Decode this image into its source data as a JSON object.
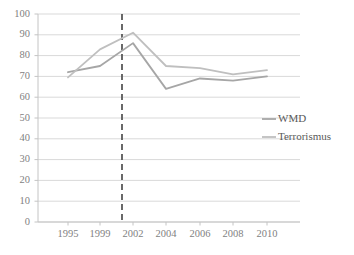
{
  "chart_data": {
    "type": "line",
    "title": "",
    "subtitle": "",
    "xlabel": "",
    "ylabel": "",
    "x": [
      1995,
      1999,
      2002,
      2004,
      2006,
      2008,
      2010
    ],
    "categories": [
      "1995",
      "1999",
      "2002",
      "2004",
      "2006",
      "2008",
      "2010"
    ],
    "series": [
      {
        "name": "WMD",
        "color": "#a6a6a6",
        "values": [
          72,
          75,
          86,
          64,
          69,
          68,
          70
        ]
      },
      {
        "name": "Terrorismus",
        "color": "#bfbfbf",
        "values": [
          69.5,
          83,
          91,
          75,
          74,
          71,
          73
        ]
      }
    ],
    "ylim": [
      0,
      100
    ],
    "ytick_values": [
      0,
      10,
      20,
      30,
      40,
      50,
      60,
      70,
      80,
      90,
      100
    ],
    "ytick_labels": [
      "0",
      "10",
      "20",
      "30",
      "40",
      "50",
      "60",
      "70",
      "80",
      "90",
      "100"
    ],
    "grid": true,
    "grid_axis": "y",
    "legend_position": "right",
    "annotations": [
      {
        "type": "vertical-dashed-line",
        "x": 2001,
        "label": "",
        "color": "#595959"
      }
    ]
  },
  "legend": {
    "entries": [
      {
        "label": "WMD",
        "color": "#a6a6a6"
      },
      {
        "label": "Terrorismus",
        "color": "#bfbfbf"
      }
    ]
  }
}
